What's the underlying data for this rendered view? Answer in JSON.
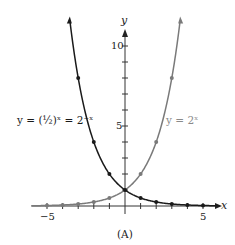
{
  "chart_data": {
    "type": "line",
    "title": "",
    "caption": "(A)",
    "xlabel": "x",
    "ylabel": "y",
    "xlim": [
      -6,
      6.3
    ],
    "ylim": [
      -0.3,
      11
    ],
    "x_ticks": [
      -5,
      -4,
      -3,
      -2,
      -1,
      1,
      2,
      3,
      4,
      5
    ],
    "x_tick_labels": [
      "-5",
      "5"
    ],
    "y_ticks": [
      1,
      2,
      3,
      4,
      5,
      6,
      7,
      8,
      9,
      10
    ],
    "y_tick_labels": [
      "5",
      "10"
    ],
    "grid": false,
    "series": [
      {
        "name": "y = (1/2)^x = 2^-x",
        "color": "#1a1a1a",
        "points_x": [
          -3,
          -2,
          -1,
          0,
          1,
          2,
          3,
          4,
          5
        ],
        "points_y": [
          8,
          4,
          2,
          1,
          0.5,
          0.25,
          0.125,
          0.0625,
          0.03125
        ]
      },
      {
        "name": "y = 2^x",
        "color": "#7a7a7a",
        "points_x": [
          -5,
          -4,
          -3,
          -2,
          -1,
          0,
          1,
          2,
          3
        ],
        "points_y": [
          0.03125,
          0.0625,
          0.125,
          0.25,
          0.5,
          1,
          2,
          4,
          8
        ]
      }
    ]
  },
  "labels": {
    "left_curve": "y = (½)ˣ = 2⁻ˣ",
    "right_curve": "y = 2ˣ",
    "x_axis": "x",
    "y_axis": "y",
    "tick_neg5": "−5",
    "tick_pos5": "5",
    "tick_y5": "5",
    "tick_y10": "10",
    "caption": "(A)"
  }
}
